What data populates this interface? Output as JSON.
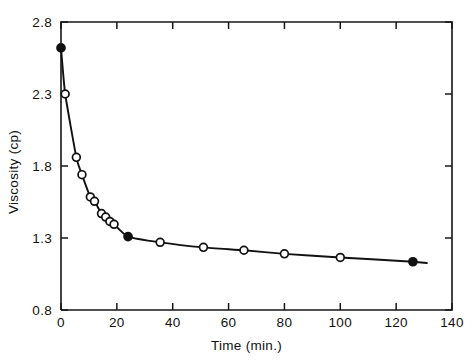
{
  "chart_data": {
    "type": "line",
    "title": "",
    "xlabel": "Time (min.)",
    "ylabel": "Viscosity (cp)",
    "xlim": [
      0,
      140
    ],
    "ylim": [
      0.8,
      2.8
    ],
    "xticks": [
      0,
      20,
      40,
      60,
      80,
      100,
      120,
      140
    ],
    "xtick_labels": [
      "0",
      "20",
      "40",
      "60",
      "80",
      "100",
      "120",
      "140"
    ],
    "yticks": [
      0.8,
      1.3,
      1.8,
      2.3,
      2.8
    ],
    "ytick_labels": [
      "0.8",
      "1.3",
      "1.8",
      "2.3",
      "2.8"
    ],
    "grid": false,
    "legend": null,
    "series": [
      {
        "name": "Viscosity vs time",
        "marker_open": "open-circle",
        "marker_filled": "filled-circle",
        "x": [
          0,
          1.5,
          5.5,
          7.5,
          10.5,
          12,
          14.5,
          16,
          17.5,
          19,
          24,
          35.5,
          51,
          65.5,
          80,
          100,
          126
        ],
        "y": [
          2.62,
          2.3,
          1.86,
          1.74,
          1.585,
          1.555,
          1.47,
          1.445,
          1.415,
          1.395,
          1.31,
          1.27,
          1.235,
          1.215,
          1.19,
          1.165,
          1.135
        ],
        "filled": [
          true,
          false,
          false,
          false,
          false,
          false,
          false,
          false,
          false,
          false,
          true,
          false,
          false,
          false,
          false,
          false,
          true
        ]
      }
    ]
  },
  "figure": {
    "axis_color": "#161616",
    "curve_color": "#111111",
    "background": "#ffffff"
  }
}
